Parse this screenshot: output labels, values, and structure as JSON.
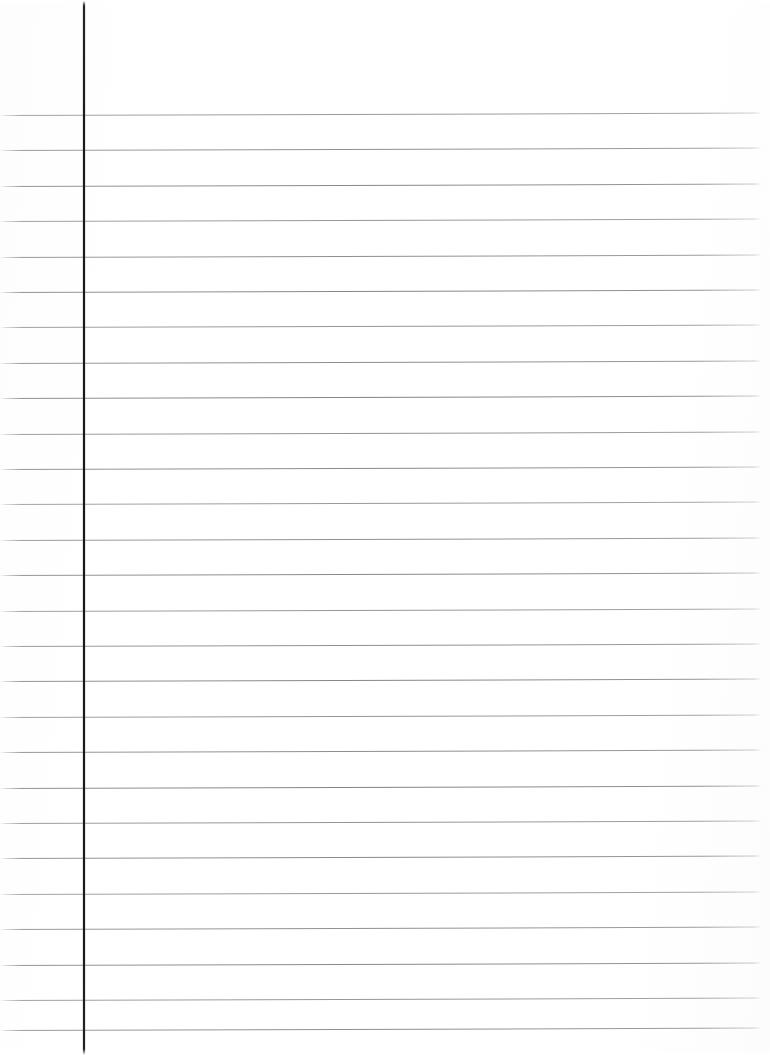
{
  "document": {
    "type": "scanned-lined-paper",
    "title": "Blank ruled notebook page",
    "content_text": "",
    "page_width": 770,
    "page_height": 1055,
    "background_color": "#ffffff"
  },
  "ruling": {
    "line_color": "#86868a",
    "line_thickness_px": 1,
    "line_spacing_px": 35.4,
    "first_line_y": 115,
    "line_count": 27,
    "line_left_x": 0,
    "line_right_x": 762,
    "line_slant_deg": -0.18,
    "line_y_positions": [
      115,
      150.4,
      185.8,
      221.2,
      256.6,
      292,
      327.4,
      362.8,
      398.2,
      433.6,
      469,
      504.4,
      539.8,
      575.2,
      610.6,
      646,
      681.4,
      716.8,
      752.2,
      787.6,
      823,
      858.4,
      893.8,
      929.2,
      964.6,
      1000,
      1030
    ]
  },
  "margin_rule": {
    "color": "#1b1b20",
    "x": 83,
    "thickness_px": 2,
    "top_y": 0,
    "bottom_y": 1055,
    "label": "left margin rule"
  }
}
